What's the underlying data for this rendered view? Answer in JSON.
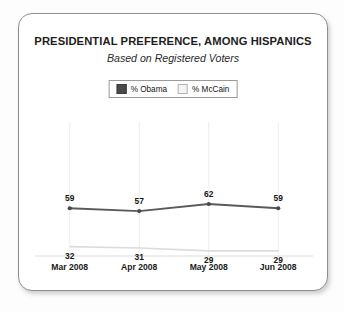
{
  "chart_data": {
    "type": "line",
    "title": "PRESIDENTIAL PREFERENCE, AMONG HISPANICS",
    "subtitle": "Based on Registered Voters",
    "categories": [
      "Mar 2008",
      "Apr 2008",
      "May 2008",
      "Jun 2008"
    ],
    "series": [
      {
        "name": "% Obama",
        "values": [
          59,
          57,
          62,
          59
        ],
        "color": "#4a4a4a",
        "label_position": "above"
      },
      {
        "name": "% McCain",
        "values": [
          32,
          31,
          29,
          29
        ],
        "color": "#dcdcdc",
        "label_position": "below"
      }
    ],
    "xlabel": "",
    "ylabel": "",
    "ylim": [
      0,
      100
    ],
    "grid": "vertical-only",
    "legend_position": "top-center",
    "axis_line_color": "#d9d9d9"
  },
  "legend": {
    "items": [
      {
        "label": "% Obama",
        "swatch": "dark-square-swatch"
      },
      {
        "label": "% McCain",
        "swatch": "light-square-swatch"
      }
    ]
  },
  "labels": {
    "obama": [
      "59",
      "57",
      "62",
      "59"
    ],
    "mccain": [
      "32",
      "31",
      "29",
      "29"
    ]
  }
}
